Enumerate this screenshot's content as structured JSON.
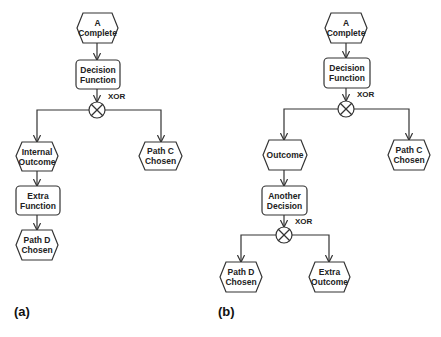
{
  "diagram_a": {
    "caption": "(a)",
    "nodes": {
      "start": {
        "type": "event",
        "label": "A\nComplete"
      },
      "decision": {
        "type": "function",
        "label": "Decision\nFunction"
      },
      "connector": {
        "type": "xor",
        "label": "XOR",
        "symbol": "✕"
      },
      "left_event": {
        "type": "event",
        "label": "Internal\nOutcome"
      },
      "right_event": {
        "type": "event",
        "label": "Path C\nChosen"
      },
      "extra_function": {
        "type": "function",
        "label": "Extra\nFunction"
      },
      "end_event": {
        "type": "event",
        "label": "Path D\nChosen"
      }
    }
  },
  "diagram_b": {
    "caption": "(b)",
    "nodes": {
      "start": {
        "type": "event",
        "label": "A\nComplete"
      },
      "decision": {
        "type": "function",
        "label": "Decision\nFunction"
      },
      "connector": {
        "type": "xor",
        "label": "XOR",
        "symbol": "✕"
      },
      "left_event": {
        "type": "event",
        "label": "Outcome"
      },
      "right_event": {
        "type": "event",
        "label": "Path C\nChosen"
      },
      "second_decision": {
        "type": "function",
        "label": "Another\nDecision"
      },
      "second_connector": {
        "type": "xor",
        "label": "XOR",
        "symbol": "✕"
      },
      "path_d": {
        "type": "event",
        "label": "Path D\nChosen"
      },
      "extra_outcome": {
        "type": "event",
        "label": "Extra\nOutcome"
      }
    }
  },
  "colors": {
    "stroke": "#333333",
    "fill": "#ffffff",
    "text": "#222222"
  }
}
